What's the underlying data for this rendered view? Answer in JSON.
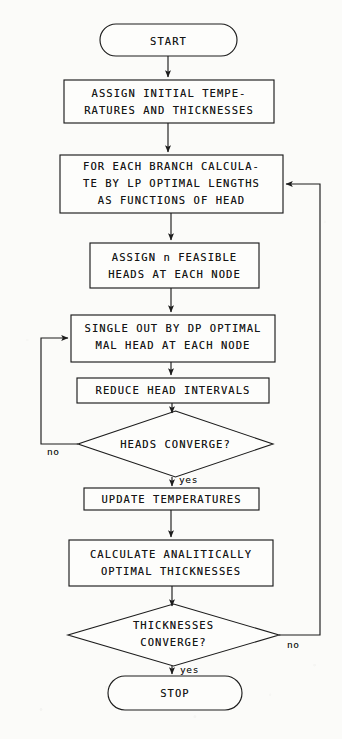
{
  "diagram": {
    "colors": {
      "ink": "#1d1d1d",
      "paper": "#fbfbf9"
    },
    "nodes": {
      "start": {
        "shape": "terminator",
        "text": "START"
      },
      "assign_initial": {
        "shape": "process",
        "line1": "ASSIGN INITIAL TEMPE-",
        "line2": "RATURES AND THICKNESSES"
      },
      "for_each_branch": {
        "shape": "process",
        "line1": "FOR EACH BRANCH CALCULA-",
        "line2": "TE BY LP OPTIMAL LENGTHS",
        "line3": "AS FUNCTIONS OF HEAD"
      },
      "assign_heads": {
        "shape": "process",
        "line1": "ASSIGN n FEASIBLE",
        "line2": "HEADS AT EACH NODE"
      },
      "single_out": {
        "shape": "process",
        "line1": "SINGLE OUT BY DP OPTIMAL",
        "line2": "MAL HEAD AT EACH NODE"
      },
      "reduce_intervals": {
        "shape": "process",
        "line1": "REDUCE HEAD INTERVALS"
      },
      "heads_converge": {
        "shape": "decision",
        "line1": "HEADS CONVERGE?"
      },
      "update_temps": {
        "shape": "process",
        "line1": "UPDATE TEMPERATURES"
      },
      "calc_thickness": {
        "shape": "process",
        "line1": "CALCULATE ANALITICALLY",
        "line2": "OPTIMAL THICKNESSES"
      },
      "thick_converge": {
        "shape": "decision",
        "line1": "THICKNESSES",
        "line2": "CONVERGE?"
      },
      "stop": {
        "shape": "terminator",
        "text": "STOP"
      }
    },
    "edge_labels": {
      "heads_no": "no",
      "heads_yes": "yes",
      "thick_no": "no",
      "thick_yes": "yes"
    }
  }
}
